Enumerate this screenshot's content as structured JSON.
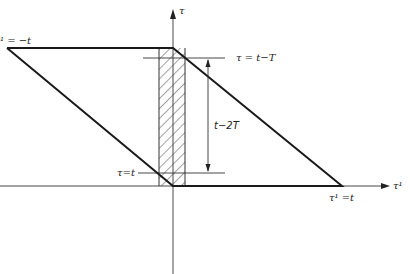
{
  "diagram": {
    "axes": {
      "vertical_label": "τ",
      "horizontal_label": "τ¹"
    },
    "labels": {
      "left_vertex": "¹ = −t",
      "upper_line": "τ = t−T",
      "dimension": "t−2T",
      "lower_line": "τ=t",
      "right_vertex": "τ¹ =t"
    },
    "colors": {
      "line": "#1a1a1a",
      "thin": "#333333",
      "background": "#ffffff"
    }
  }
}
